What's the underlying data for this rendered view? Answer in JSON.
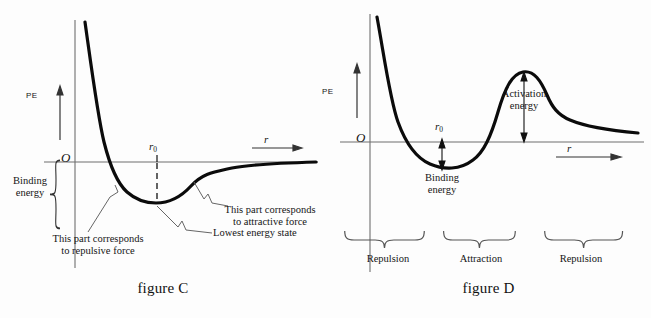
{
  "figure_c": {
    "caption": "figure C",
    "axis": {
      "y_label": "PE",
      "origin_label": "O",
      "x_label": "r",
      "r0_label": "r",
      "r0_sub": "0"
    },
    "annotations": {
      "binding_energy": "Binding\nenergy",
      "repulsive": "This part corresponds\nto repulsive force",
      "attractive": "This part corresponds\nto attractive force",
      "lowest": "Lowest energy state"
    }
  },
  "figure_d": {
    "caption": "figure D",
    "axis": {
      "y_label": "PE",
      "origin_label": "O",
      "x_label": "r",
      "r0_label": "r",
      "r0_sub": "0"
    },
    "annotations": {
      "binding_energy": "Binding\nenergy",
      "activation_energy": "Activation\nenergy"
    },
    "regions": [
      {
        "label": "Repulsion"
      },
      {
        "label": "Attraction"
      },
      {
        "label": "Repulsion"
      }
    ]
  },
  "chart_data": [
    {
      "type": "line",
      "title": "figure C",
      "xlabel": "r",
      "ylabel": "PE",
      "description": "Lennard-Jones style interatomic potential energy curve: steep repulsive wall at small r, minimum (lowest energy state) at r0, asymptotic approach to zero at large r.",
      "grid": false,
      "legend": "none",
      "axis_origin_label": "O",
      "markers": {
        "r0": "equilibrium separation",
        "well_depth": "binding energy"
      },
      "series": [
        {
          "name": "potential energy",
          "x": [
            0.9,
            0.95,
            1.0,
            1.05,
            1.12,
            1.2,
            1.3,
            1.45,
            1.6,
            1.8,
            2.0,
            2.2,
            2.45,
            2.8,
            3.2,
            3.7,
            4.3,
            5.0,
            6.0,
            7.5
          ],
          "y": [
            9.0,
            5.2,
            2.8,
            1.4,
            0.4,
            -0.3,
            -0.78,
            -0.98,
            -1.0,
            -0.9,
            -0.74,
            -0.58,
            -0.44,
            -0.3,
            -0.2,
            -0.13,
            -0.08,
            -0.05,
            -0.03,
            -0.01
          ]
        }
      ],
      "xlim": [
        0.85,
        8.0
      ],
      "ylim": [
        -1.35,
        9.5
      ]
    },
    {
      "type": "line",
      "title": "figure D",
      "xlabel": "r",
      "ylabel": "PE",
      "description": "Potential energy curve with an activation barrier: repulsive wall, binding-energy well at r0, energy maximum (activation energy) and a second repulsive tail decaying toward zero.",
      "grid": false,
      "legend": "none",
      "axis_origin_label": "O",
      "markers": {
        "r0": "equilibrium separation",
        "well_depth": "binding energy",
        "peak_height": "activation energy"
      },
      "regions": [
        {
          "label": "Repulsion",
          "x_range": [
            0.85,
            2.45
          ]
        },
        {
          "label": "Attraction",
          "x_range": [
            2.45,
            4.35
          ]
        },
        {
          "label": "Repulsion",
          "x_range": [
            4.35,
            8.0
          ]
        }
      ],
      "series": [
        {
          "name": "potential energy",
          "x": [
            0.9,
            1.0,
            1.15,
            1.3,
            1.5,
            1.75,
            2.0,
            2.3,
            2.6,
            2.9,
            3.2,
            3.5,
            3.8,
            4.1,
            4.4,
            4.7,
            5.0,
            5.4,
            5.9,
            6.5,
            7.2,
            8.0
          ],
          "y": [
            9.0,
            5.0,
            2.3,
            0.8,
            -0.55,
            -1.35,
            -1.7,
            -1.72,
            -1.4,
            -0.6,
            0.55,
            1.8,
            2.75,
            3.1,
            2.95,
            2.4,
            1.85,
            1.35,
            1.0,
            0.75,
            0.58,
            0.45
          ]
        }
      ],
      "xlim": [
        0.85,
        8.0
      ],
      "ylim": [
        -2.0,
        9.5
      ]
    }
  ]
}
